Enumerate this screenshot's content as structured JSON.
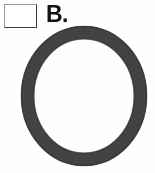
{
  "figure": {
    "background_color": "#fefefe",
    "checkbox": {
      "name": "answer-checkbox",
      "checked": false,
      "fill_color": "#ffffff",
      "border_light_color": "#9a9a9a",
      "border_dark_color": "#3f3f3f"
    },
    "label": {
      "text": "B.",
      "color": "#111111"
    },
    "shape": {
      "name": "circle-outline",
      "type": "annulus",
      "description": "thick dark gray ring",
      "stroke_color": "#5a5a5a",
      "stroke_edge_color": "#4a4a4a",
      "interior_color": "#ffffff",
      "outer_width": 128,
      "outer_height": 142,
      "stroke_width": 13,
      "texture": "mottled halftone"
    }
  }
}
